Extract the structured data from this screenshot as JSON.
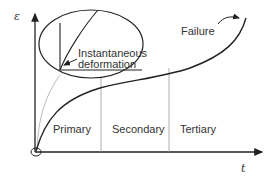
{
  "diagram": {
    "axes": {
      "y_label": "ε",
      "x_label": "t"
    },
    "stages": [
      {
        "label": "Primary"
      },
      {
        "label": "Secondary"
      },
      {
        "label": "Tertiary"
      }
    ],
    "annotations": {
      "failure": "Failure",
      "inset_line1": "Instantaneous",
      "inset_line2": "deformation"
    },
    "colors": {
      "line": "#222222",
      "divider": "#999999",
      "leader": "#aaaaaa"
    }
  }
}
